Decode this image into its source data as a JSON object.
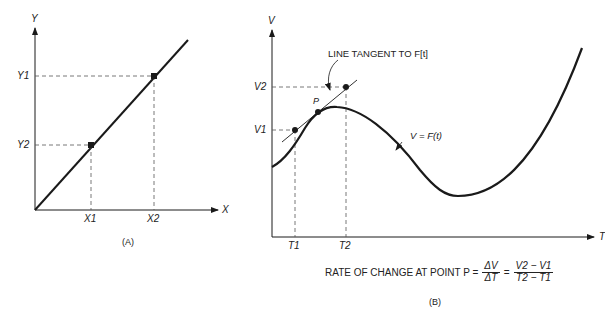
{
  "panel_a": {
    "caption": "(A)",
    "y_axis_label": "Y",
    "x_axis_label": "X",
    "y_ticks": [
      "Y1",
      "Y2"
    ],
    "x_ticks": [
      "X1",
      "X2"
    ]
  },
  "panel_b": {
    "caption": "(B)",
    "y_axis_label": "V",
    "x_axis_label": "T",
    "y_ticks": [
      "V2",
      "V1"
    ],
    "x_ticks": [
      "T1",
      "T2"
    ],
    "point_label": "P",
    "tangent_annotation": "LINE TANGENT TO F[t]",
    "curve_annotation": "V = F(t)",
    "formula": {
      "prefix": "RATE OF CHANGE AT POINT P =",
      "frac1_num": "ΔV",
      "frac1_den": "ΔT",
      "equals": "=",
      "frac2_num": "V2 − V1",
      "frac2_den": "T2 − T1"
    }
  },
  "colors": {
    "ink": "#1a1a1a",
    "background": "#ffffff"
  }
}
